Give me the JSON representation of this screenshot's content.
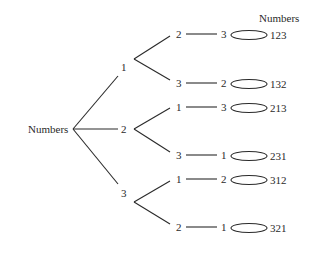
{
  "diagram": {
    "type": "tree",
    "root_label": "Numbers",
    "result_header": "Numbers",
    "level1": [
      {
        "label": "1",
        "x": 124,
        "y": 67
      },
      {
        "label": "2",
        "x": 124,
        "y": 129
      },
      {
        "label": "3",
        "x": 124,
        "y": 193
      }
    ],
    "level2": [
      {
        "label": "2",
        "x": 177,
        "y": 33
      },
      {
        "label": "3",
        "x": 177,
        "y": 82
      },
      {
        "label": "1",
        "x": 177,
        "y": 106
      },
      {
        "label": "3",
        "x": 177,
        "y": 154
      },
      {
        "label": "1",
        "x": 177,
        "y": 178
      },
      {
        "label": "2",
        "x": 177,
        "y": 226
      }
    ],
    "level3": [
      {
        "label": "3",
        "x": 222,
        "y": 33
      },
      {
        "label": "2",
        "x": 222,
        "y": 82
      },
      {
        "label": "3",
        "x": 222,
        "y": 106
      },
      {
        "label": "1",
        "x": 222,
        "y": 154
      },
      {
        "label": "2",
        "x": 222,
        "y": 178
      },
      {
        "label": "1",
        "x": 222,
        "y": 226
      }
    ],
    "results": [
      {
        "label": "123",
        "y": 33
      },
      {
        "label": "132",
        "y": 82
      },
      {
        "label": "213",
        "y": 106
      },
      {
        "label": "231",
        "y": 154
      },
      {
        "label": "312",
        "y": 178
      },
      {
        "label": "321",
        "y": 226
      }
    ]
  }
}
